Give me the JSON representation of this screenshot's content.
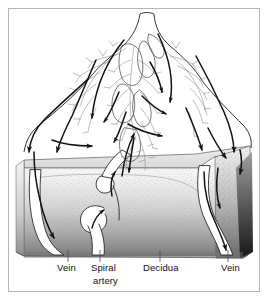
{
  "figure": {
    "kind": "anatomical-diagram",
    "background_color": "#ffffff",
    "frame_border_color": "#b5b5b5",
    "ink_color": "#111111",
    "villi_color": "#8a8a8a",
    "decidua_light": "#f2f2f2",
    "decidua_dark": "#6f6f6f",
    "decidua_shadow": "#1a1a1a",
    "vessel_fill": "#ffffff"
  },
  "labels": [
    {
      "id": "vein-left",
      "text": "Vein",
      "x": 57,
      "y": 267,
      "leader_x": 68,
      "leader_top": 250,
      "leader_bottom": 262
    },
    {
      "id": "spiral-artery",
      "text": "Spiral",
      "x": 91,
      "y": 267,
      "leader_x": 100,
      "leader_top": 250,
      "leader_bottom": 262
    },
    {
      "id": "spiral-artery-2",
      "text": "artery",
      "x": 93,
      "y": 280,
      "leader_x": null,
      "leader_top": null,
      "leader_bottom": null
    },
    {
      "id": "decidua",
      "text": "Decidua",
      "x": 143,
      "y": 267,
      "leader_x": 160,
      "leader_top": 250,
      "leader_bottom": 262
    },
    {
      "id": "vein-right",
      "text": "Vein",
      "x": 221,
      "y": 267,
      "leader_x": 228,
      "leader_top": 250,
      "leader_bottom": 262
    }
  ],
  "structures": {
    "umbilical_cord": "umbilical-cord",
    "villous_tree": "chorionic-villous-tree",
    "decidua_block": "decidua-basalis-block",
    "spiral_arteries": [
      "spiral-artery-upper",
      "spiral-artery-lower"
    ],
    "veins": [
      "vein-left-channel",
      "vein-right-channel"
    ],
    "flow_arrows": "maternal-blood-flow-arrows"
  }
}
